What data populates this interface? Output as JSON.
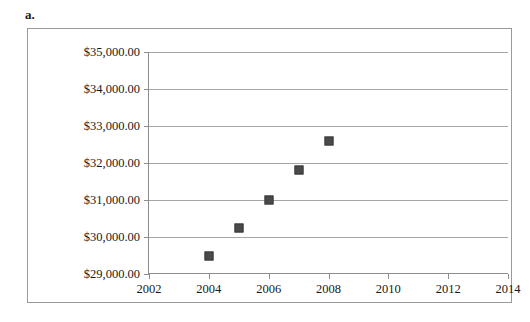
{
  "figure": {
    "label": "a."
  },
  "chart_data": {
    "type": "scatter",
    "title": "",
    "xlabel": "",
    "ylabel": "",
    "grid": true,
    "legend": false,
    "xlim": [
      2002,
      2014
    ],
    "ylim": [
      29000,
      35000
    ],
    "x": [
      2004,
      2005,
      2006,
      2007,
      2008
    ],
    "values": [
      29500,
      30250,
      31000,
      31800,
      32600
    ],
    "series": [
      {
        "name": "",
        "marker": "square",
        "color": "#4a4a4a",
        "points": [
          {
            "x": 2004,
            "y": 29500
          },
          {
            "x": 2005,
            "y": 30250
          },
          {
            "x": 2006,
            "y": 31000
          },
          {
            "x": 2007,
            "y": 31800
          },
          {
            "x": 2008,
            "y": 32600
          }
        ]
      }
    ],
    "yticks": [
      29000,
      30000,
      31000,
      32000,
      33000,
      34000,
      35000
    ],
    "ytick_labels": [
      "$29,000.00",
      "$30,000.00",
      "$31,000.00",
      "$32,000.00",
      "$33,000.00",
      "$34,000.00",
      "$35,000.00"
    ],
    "xticks": [
      2002,
      2004,
      2006,
      2008,
      2010,
      2012,
      2014
    ],
    "xtick_labels": [
      "2002",
      "2004",
      "2006",
      "2008",
      "2010",
      "2012",
      "2014"
    ],
    "colors": {
      "marker": "#4a4a4a",
      "gridline": "#a6a6a6",
      "axis": "#8d8d8d",
      "frame": "#9a9a9a",
      "background": "#ffffff",
      "text": "#1a1a1a"
    }
  }
}
